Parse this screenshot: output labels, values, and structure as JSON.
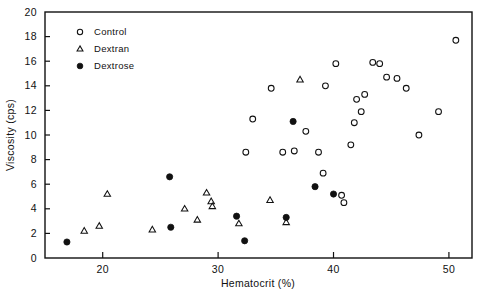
{
  "chart_data": {
    "type": "scatter",
    "title": "",
    "xlabel": "Hematocrit (%)",
    "ylabel": "Viscosity (cps)",
    "xlim": [
      15,
      52
    ],
    "ylim": [
      0,
      20
    ],
    "xticks": [
      20,
      30,
      40,
      50
    ],
    "xtick_labels": [
      "20",
      "30",
      "40",
      "50"
    ],
    "yticks": [
      0,
      2,
      4,
      6,
      8,
      10,
      12,
      14,
      16,
      18,
      20
    ],
    "ytick_labels": [
      "0",
      "2",
      "4",
      "6",
      "8",
      "10",
      "12",
      "14",
      "16",
      "18",
      "20"
    ],
    "grid": false,
    "legend_position": "top-left-inside",
    "frame": "box",
    "series": [
      {
        "name": "Control",
        "marker": "open-circle",
        "color": "#111111",
        "points": [
          [
            32.4,
            8.6
          ],
          [
            33.0,
            11.3
          ],
          [
            34.6,
            13.8
          ],
          [
            35.6,
            8.6
          ],
          [
            36.6,
            8.7
          ],
          [
            37.6,
            10.3
          ],
          [
            38.7,
            8.6
          ],
          [
            39.1,
            6.9
          ],
          [
            39.3,
            14.0
          ],
          [
            40.2,
            15.8
          ],
          [
            40.7,
            5.1
          ],
          [
            40.9,
            4.5
          ],
          [
            41.5,
            9.2
          ],
          [
            41.8,
            11.0
          ],
          [
            42.0,
            12.9
          ],
          [
            42.4,
            11.9
          ],
          [
            42.7,
            13.3
          ],
          [
            43.4,
            15.9
          ],
          [
            44.0,
            15.8
          ],
          [
            44.6,
            14.7
          ],
          [
            45.5,
            14.6
          ],
          [
            46.3,
            13.8
          ],
          [
            47.4,
            10.0
          ],
          [
            49.1,
            11.9
          ],
          [
            50.6,
            17.7
          ]
        ]
      },
      {
        "name": "Dextran",
        "marker": "open-triangle",
        "color": "#111111",
        "points": [
          [
            18.4,
            2.2
          ],
          [
            19.7,
            2.6
          ],
          [
            20.4,
            5.2
          ],
          [
            24.3,
            2.3
          ],
          [
            27.1,
            4.0
          ],
          [
            28.2,
            3.1
          ],
          [
            29.0,
            5.3
          ],
          [
            29.4,
            4.6
          ],
          [
            29.5,
            4.2
          ],
          [
            31.8,
            2.8
          ],
          [
            34.5,
            4.7
          ],
          [
            35.9,
            2.9
          ],
          [
            37.1,
            14.5
          ]
        ]
      },
      {
        "name": "Dextrose",
        "marker": "filled-circle",
        "color": "#111111",
        "points": [
          [
            16.9,
            1.3
          ],
          [
            25.8,
            6.6
          ],
          [
            25.9,
            2.5
          ],
          [
            31.6,
            3.4
          ],
          [
            32.3,
            1.4
          ],
          [
            35.9,
            3.3
          ],
          [
            36.5,
            11.1
          ],
          [
            38.4,
            5.8
          ],
          [
            40.0,
            5.2
          ]
        ]
      }
    ]
  },
  "legend": {
    "entries": [
      {
        "label": "Control",
        "marker": "open-circle"
      },
      {
        "label": "Dextran",
        "marker": "open-triangle"
      },
      {
        "label": "Dextrose",
        "marker": "filled-circle"
      }
    ]
  },
  "axes": {
    "x_title": "Hematocrit (%)",
    "y_title": "Viscosity (cps)"
  }
}
